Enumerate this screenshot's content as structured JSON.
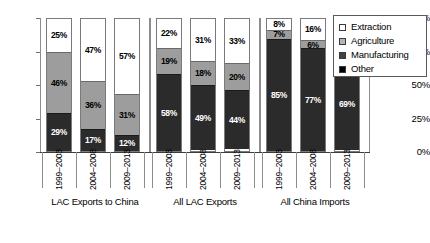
{
  "chart_data": {
    "type": "bar",
    "subtype": "stacked-percentage-column",
    "title": "",
    "xlabel": "",
    "ylabel": "",
    "ylim": [
      0,
      100
    ],
    "y_ticks": [
      "0%",
      "25%",
      "50%",
      "75%",
      "100%"
    ],
    "grid": false,
    "legend_position": "top-right",
    "categories": [
      "1999–2003",
      "2004–2008",
      "2009–2013"
    ],
    "groups": [
      {
        "name": "LAC Exports to China",
        "bars": [
          {
            "category": "1999–2003",
            "segments": [
              {
                "name": "Extraction",
                "value": 25,
                "label": "25%"
              },
              {
                "name": "Agriculture",
                "value": 46,
                "label": "46%"
              },
              {
                "name": "Manufacturing",
                "value": 29,
                "label": "29%"
              }
            ]
          },
          {
            "category": "2004–2008",
            "segments": [
              {
                "name": "Extraction",
                "value": 47,
                "label": "47%"
              },
              {
                "name": "Agriculture",
                "value": 36,
                "label": "36%"
              },
              {
                "name": "Manufacturing",
                "value": 17,
                "label": "17%"
              }
            ]
          },
          {
            "category": "2009–2013",
            "segments": [
              {
                "name": "Extraction",
                "value": 57,
                "label": "57%"
              },
              {
                "name": "Agriculture",
                "value": 31,
                "label": "31%"
              },
              {
                "name": "Manufacturing",
                "value": 12,
                "label": "12%"
              }
            ]
          }
        ]
      },
      {
        "name": "All LAC Exports",
        "bars": [
          {
            "category": "1999–2003",
            "segments": [
              {
                "name": "Extraction",
                "value": 22,
                "label": "22%"
              },
              {
                "name": "Agriculture",
                "value": 19,
                "label": "19%"
              },
              {
                "name": "Manufacturing",
                "value": 58,
                "label": "58%"
              }
            ]
          },
          {
            "category": "2004–2008",
            "segments": [
              {
                "name": "Extraction",
                "value": 31,
                "label": "31%"
              },
              {
                "name": "Agriculture",
                "value": 18,
                "label": "18%"
              },
              {
                "name": "Manufacturing",
                "value": 49,
                "label": "49%"
              }
            ]
          },
          {
            "category": "2009–2013",
            "segments": [
              {
                "name": "Extraction",
                "value": 33,
                "label": "33%"
              },
              {
                "name": "Agriculture",
                "value": 20,
                "label": "20%"
              },
              {
                "name": "Manufacturing",
                "value": 44,
                "label": "44%"
              }
            ]
          }
        ]
      },
      {
        "name": "All China Imports",
        "bars": [
          {
            "category": "1999–2003",
            "segments": [
              {
                "name": "Extraction",
                "value": 8,
                "label": "8%"
              },
              {
                "name": "Agriculture",
                "value": 7,
                "label": "7%"
              },
              {
                "name": "Manufacturing",
                "value": 85,
                "label": "85%"
              }
            ]
          },
          {
            "category": "2004–2008",
            "segments": [
              {
                "name": "Extraction",
                "value": 16,
                "label": "16%"
              },
              {
                "name": "Agriculture",
                "value": 6,
                "label": "6%"
              },
              {
                "name": "Manufacturing",
                "value": 77,
                "label": "77%"
              }
            ]
          },
          {
            "category": "2009–2013",
            "segments": [
              {
                "name": "Extraction",
                "value": 22,
                "label": "22%"
              },
              {
                "name": "Agriculture",
                "value": 7,
                "label": "7%"
              },
              {
                "name": "Manufacturing",
                "value": 69,
                "label": "69%"
              }
            ]
          }
        ]
      }
    ],
    "legend": [
      {
        "label": "Extraction",
        "key": "extraction",
        "color": "#ffffff"
      },
      {
        "label": "Agriculture",
        "key": "agriculture",
        "color": "#b4b4b4"
      },
      {
        "label": "Manufacturing",
        "key": "manufacturing",
        "color": "#404040"
      },
      {
        "label": "Other",
        "key": "other",
        "color": "#000000"
      }
    ]
  }
}
